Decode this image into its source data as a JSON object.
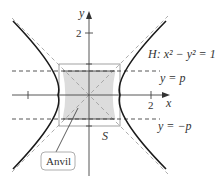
{
  "diagram": {
    "hyperbola_label": "H: x² − y² = 1",
    "line_upper_label": "y = p",
    "line_lower_label": "y = −p",
    "square_label": "S",
    "region_label": "Anvil",
    "x_axis_label": "x",
    "y_axis_label": "y",
    "x_tick_label": "2",
    "y_tick_label": "2",
    "colors": {
      "curve": "#222222",
      "asymptote": "#999999",
      "shade": "#d9d9d9",
      "square": "#888888"
    }
  }
}
